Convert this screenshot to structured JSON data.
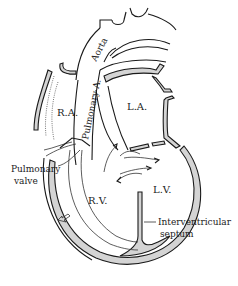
{
  "diagram": {
    "labels": {
      "aorta": "Aorta",
      "pulmonary_artery": "Pulmonary A.",
      "right_atrium": "R.A.",
      "left_atrium": "L.A.",
      "right_ventricle": "R.V.",
      "left_ventricle": "L.V.",
      "pulmonary_valve": "Pulmonary",
      "pulmonary_valve_2": "valve",
      "interventricular_septum": "Interventricular",
      "interventricular_septum_2": "septum"
    },
    "colors": {
      "ink": "#1a1a1a",
      "wall_fill": "#d4d4d4",
      "background": "#ffffff"
    }
  }
}
